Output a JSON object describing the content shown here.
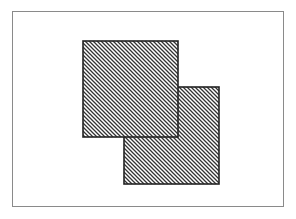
{
  "figure": {
    "frame": {
      "x": 12,
      "y": 11,
      "width": 273,
      "height": 196,
      "stroke": "#8a8a8a"
    },
    "shapes": [
      {
        "id": "square-back",
        "x": 124,
        "y": 87,
        "width": 95,
        "height": 97,
        "hatch": "diagonal",
        "stroke": "#222222"
      },
      {
        "id": "square-front",
        "x": 83,
        "y": 41,
        "width": 95,
        "height": 96,
        "hatch": "diagonal",
        "stroke": "#222222"
      }
    ],
    "hatch_spacing": 4
  }
}
